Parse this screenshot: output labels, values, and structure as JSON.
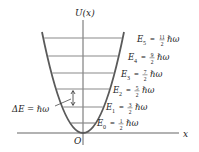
{
  "diagram": {
    "y_axis_label": "U(x)",
    "x_axis_label": "x",
    "origin_label": "O",
    "spacing_label": "ΔE = ℏω",
    "colors": {
      "curve": "#555555",
      "levels": "#8a8a8a",
      "axes": "#555555",
      "text": "#222222"
    },
    "levels": [
      {
        "name": "E0",
        "sub": "0",
        "num": "1",
        "den": "2",
        "unit": "ℏω",
        "y": 123
      },
      {
        "name": "E1",
        "sub": "1",
        "num": "3",
        "den": "2",
        "unit": "ℏω",
        "y": 107
      },
      {
        "name": "E2",
        "sub": "2",
        "num": "5",
        "den": "2",
        "unit": "ℏω",
        "y": 89
      },
      {
        "name": "E3",
        "sub": "3",
        "num": "7",
        "den": "2",
        "unit": "ℏω",
        "y": 73
      },
      {
        "name": "E4",
        "sub": "4",
        "num": "9",
        "den": "2",
        "unit": "ℏω",
        "y": 56
      },
      {
        "name": "E5",
        "sub": "5",
        "num": "11",
        "den": "2",
        "unit": "ℏω",
        "y": 38
      }
    ]
  }
}
